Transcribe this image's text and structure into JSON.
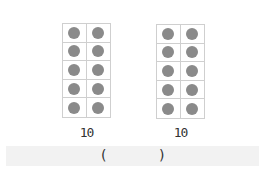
{
  "frames": [
    {
      "label": "10",
      "rows": 5,
      "cols": 2,
      "filled": 10
    },
    {
      "label": "10",
      "rows": 5,
      "cols": 2,
      "filled": 10
    }
  ],
  "answer": {
    "open": "(",
    "close": ")",
    "value": ""
  },
  "colors": {
    "dot": "#8a8a8a",
    "grid": "#cfcfcf",
    "band": "#f2f2f2"
  }
}
